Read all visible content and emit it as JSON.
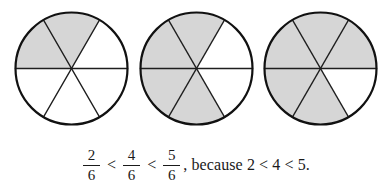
{
  "figure": {
    "shade_color": "#d6d6d6",
    "outline_color": "#111111",
    "background_color": "#ffffff",
    "sectors_per_circle": 6,
    "circles": [
      {
        "name": "two-sixths",
        "shaded_count": 2,
        "total_count": 6,
        "fraction_label": "2/6",
        "shaded_sectors": [
          3,
          4
        ]
      },
      {
        "name": "four-sixths",
        "shaded_count": 4,
        "total_count": 6,
        "fraction_label": "4/6",
        "shaded_sectors": [
          2,
          3,
          4,
          5
        ]
      },
      {
        "name": "five-sixths",
        "shaded_count": 5,
        "total_count": 6,
        "fraction_label": "5/6",
        "shaded_sectors": [
          1,
          2,
          3,
          4,
          5
        ]
      }
    ]
  },
  "caption": {
    "fraction_1": {
      "numerator": "2",
      "denominator": "6"
    },
    "relation_1": "<",
    "fraction_2": {
      "numerator": "4",
      "denominator": "6"
    },
    "relation_2": "<",
    "fraction_3": {
      "numerator": "5",
      "denominator": "6"
    },
    "tail_text": ", because 2 < 4 < 5."
  }
}
